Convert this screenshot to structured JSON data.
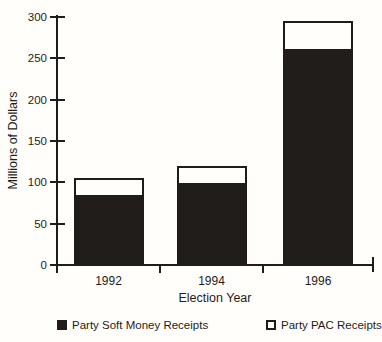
{
  "colors": {
    "ink": "#1f1c19",
    "paper": "#fffefa",
    "bar_fill": "#211d1a"
  },
  "chart_data": {
    "type": "bar",
    "stacked": true,
    "title": "",
    "xlabel": "Election Year",
    "ylabel": "Millions of Dollars",
    "categories": [
      "1992",
      "1994",
      "1996"
    ],
    "series": [
      {
        "name": "Party Soft Money Receipts",
        "style": "filled-black",
        "values": [
          86,
          101,
          262
        ]
      },
      {
        "name": "Party PAC Receipts",
        "style": "hollow-white",
        "values": [
          19,
          19,
          33
        ]
      }
    ],
    "totals": [
      105,
      120,
      295
    ],
    "ylim": [
      0,
      300
    ],
    "yticks": [
      0,
      50,
      100,
      150,
      200,
      250,
      300
    ],
    "grid": false,
    "legend_position": "bottom"
  }
}
